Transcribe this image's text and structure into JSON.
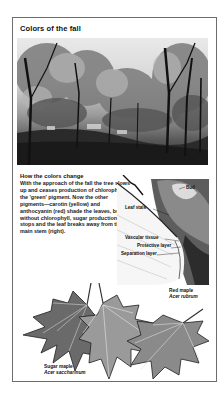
{
  "panel": {
    "title": "Colors of the fall",
    "photo_alt": "Autumn trees in a park",
    "section": {
      "heading": "How the colors change",
      "body": "With the approach of the fall the tree slows up and ceases production of chlorophyll, the 'green' pigment. Now the other pigments—carotin (yellow) and anthocyanin (red) shade the leaves, but without chlorophyll, sugar production stops and the leaf breaks away from the main stem (right)."
    },
    "diagram": {
      "labels": {
        "bud": "Bud",
        "leaf_stalk": "Leaf stalk",
        "vascular_tissue": "Vascular tissue",
        "protective_layer": "Protective layer",
        "separation_layer": "Separation layer"
      }
    },
    "leaves": {
      "red_maple": {
        "common": "Red maple",
        "scientific": "Acer rubrum"
      },
      "sugar_maple": {
        "common": "Sugar maple",
        "scientific": "Acer saccharinum"
      }
    }
  },
  "colors": {
    "frame_border": "#6d6d6d",
    "text": "#111111",
    "background": "#ffffff"
  }
}
